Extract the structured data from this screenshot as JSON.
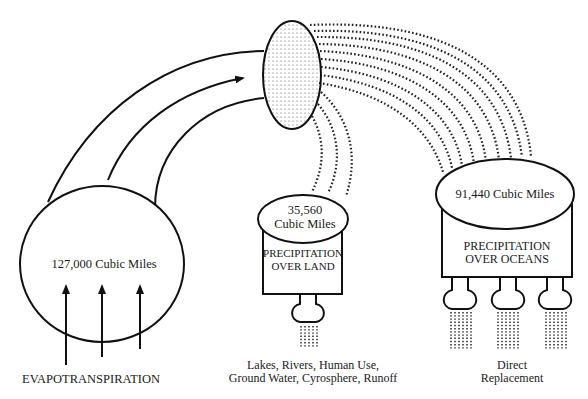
{
  "diagram": {
    "colors": {
      "ink": "#111111",
      "background": "#ffffff"
    },
    "evaporation": {
      "volume_label": "127,000 Cubic Miles",
      "caption": "EVAPOTRANSPIRATION"
    },
    "cloud": {
      "icon": "cloud-stippled-ellipse"
    },
    "land": {
      "volume_line1": "35,560",
      "volume_line2": "Cubic Miles",
      "box_line1": "PRECIPITATION",
      "box_line2": "OVER LAND",
      "caption_line1": "Lakes, Rivers, Human Use,",
      "caption_line2": "Ground Water, Cyrosphere, Runoff"
    },
    "ocean": {
      "volume_label": "91,440 Cubic Miles",
      "box_line1": "PRECIPITATION",
      "box_line2": "OVER OCEANS",
      "caption_line1": "Direct",
      "caption_line2": "Replacement"
    }
  }
}
